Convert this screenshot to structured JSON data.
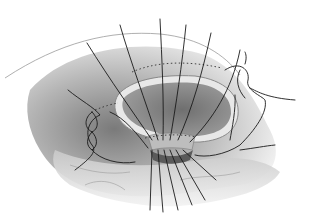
{
  "illustration": {
    "subject": "surgical suture illustration",
    "style": "grayscale pencil drawing",
    "suture_count_top": 7,
    "colors": {
      "background": "#ffffff",
      "tissue_dark": "#6e6e6e",
      "tissue_mid": "#a8a8a8",
      "tissue_light": "#d9d9d9",
      "suture": "#1a1a1a",
      "opening": "#8a8a8a"
    }
  }
}
